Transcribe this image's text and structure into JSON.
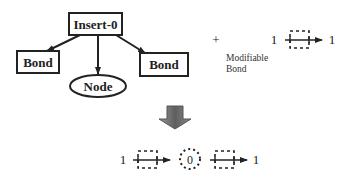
{
  "tree": {
    "root": {
      "label": "Insert-0"
    },
    "children": [
      {
        "label": "Bond",
        "shape": "rectangle"
      },
      {
        "label": "Node",
        "shape": "ellipse"
      },
      {
        "label": "Bond",
        "shape": "rectangle"
      }
    ]
  },
  "plus": "+",
  "modifiable_bond": {
    "caption_line1": "Modifiable",
    "caption_line2": "Bond",
    "left_label": "1",
    "right_label": "1"
  },
  "transform_arrow": {
    "direction": "down",
    "color": "#666666"
  },
  "result": {
    "left_label": "1",
    "center_node_label": "0",
    "right_label": "1"
  },
  "colors": {
    "stroke": "#222222",
    "background": "#ffffff"
  }
}
